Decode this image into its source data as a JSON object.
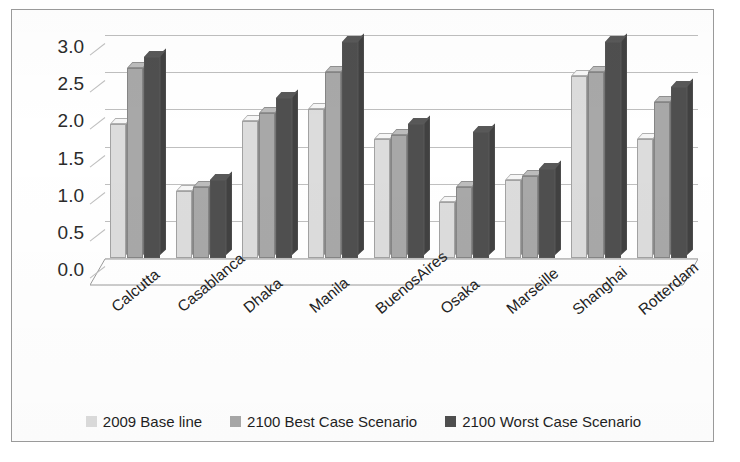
{
  "chart_data": {
    "type": "bar",
    "title": "",
    "subtitle": "",
    "xlabel": "",
    "ylabel": "",
    "ylim": [
      0.0,
      3.0
    ],
    "yticks": [
      "0.0",
      "0.5",
      "1.0",
      "1.5",
      "2.0",
      "2.5",
      "3.0"
    ],
    "ytick_values": [
      0.0,
      0.5,
      1.0,
      1.5,
      2.0,
      2.5,
      3.0
    ],
    "grid": true,
    "legend_position": "bottom",
    "orientation": "vertical-grouped-3d",
    "categories": [
      "Calcutta",
      "Casablanca",
      "Dhaka",
      "Manila",
      "BuenosAires",
      "Osaka",
      "Marseille",
      "Shanghai",
      "Rotterdam"
    ],
    "series": [
      {
        "name": "2009 Base line",
        "color": "#dcdcdc",
        "values": [
          1.8,
          0.9,
          1.85,
          2.0,
          1.6,
          0.75,
          1.05,
          2.45,
          1.6
        ]
      },
      {
        "name": "2100 Best Case Scenario",
        "color": "#a8a8a8",
        "values": [
          2.55,
          0.95,
          1.95,
          2.5,
          1.65,
          0.95,
          1.1,
          2.5,
          2.1
        ]
      },
      {
        "name": "2100 Worst Case Scenario",
        "color": "#4f4f4f",
        "values": [
          2.7,
          1.05,
          2.15,
          2.9,
          1.8,
          1.7,
          1.2,
          2.9,
          2.3
        ]
      }
    ]
  },
  "legend": {
    "items": [
      {
        "label": "2009 Base line",
        "color": "#dcdcdc"
      },
      {
        "label": "2100 Best Case Scenario",
        "color": "#a8a8a8"
      },
      {
        "label": "2100 Worst Case Scenario",
        "color": "#4f4f4f"
      }
    ]
  },
  "colors": {
    "frame_border": "#9a9a9a",
    "gridline": "#bfbfbf",
    "text": "#232323",
    "background": "#ffffff"
  }
}
